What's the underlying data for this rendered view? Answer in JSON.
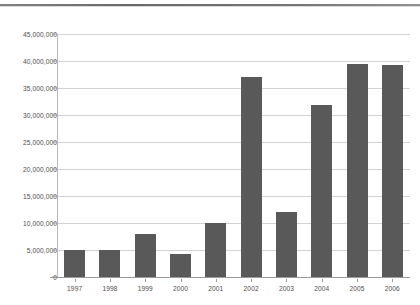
{
  "chart_data": {
    "type": "bar",
    "title": "",
    "subtitle": "",
    "xlabel": "",
    "ylabel": "",
    "categories": [
      "1997",
      "1998",
      "1999",
      "2000",
      "2001",
      "2002",
      "2003",
      "2004",
      "2005",
      "2006"
    ],
    "values": [
      5000000,
      5000000,
      8000000,
      4200000,
      10000000,
      37000000,
      12000000,
      31800000,
      39500000,
      39300000
    ],
    "ylim": [
      0,
      45000000
    ],
    "ytick_values": [
      0,
      5000000,
      10000000,
      15000000,
      20000000,
      25000000,
      30000000,
      35000000,
      40000000,
      45000000
    ],
    "ytick_labels": [
      "0",
      "5,000,000",
      "10,000,000",
      "15,000,000",
      "20,000,000",
      "25,000,000",
      "30,000,000",
      "35,000,000",
      "40,000,000",
      "45,000,000"
    ],
    "grid": true,
    "legend": false,
    "legend_position": "none",
    "bar_color": "#595959",
    "gridline_color": "#d2d2d2",
    "axis_color": "#9a9a9a",
    "background_color": "#ffffff"
  }
}
